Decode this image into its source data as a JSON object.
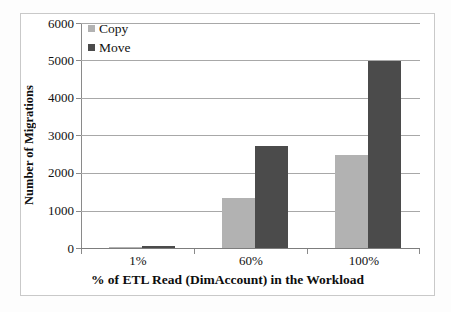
{
  "chart_data": {
    "type": "bar",
    "title": "",
    "subtitle": "",
    "categories": [
      "1%",
      "60%",
      "100%"
    ],
    "series": [
      {
        "name": "Copy",
        "color": "#b2b2b2",
        "values": [
          25,
          1340,
          2480
        ]
      },
      {
        "name": "Move",
        "color": "#4b4b4b",
        "values": [
          40,
          2720,
          4980
        ]
      }
    ],
    "xlabel": "% of ETL Read (DimAccount) in the Workload",
    "ylabel": "Number of Migrations",
    "ylim": [
      0,
      6000
    ],
    "ytick_labels": [
      "0",
      "1000",
      "2000",
      "3000",
      "4000",
      "5000",
      "6000"
    ],
    "ytick_values": [
      0,
      1000,
      2000,
      3000,
      4000,
      5000,
      6000
    ],
    "grid": "horizontal",
    "legend_position": "top-left",
    "background_color": "#ffffff",
    "gridline_color": "#a8a8a8",
    "axis_color": "#8a8a8a",
    "frame_color": "#c9c9c9"
  },
  "legend": {
    "entries": [
      {
        "label": "Copy"
      },
      {
        "label": "Move"
      }
    ]
  }
}
